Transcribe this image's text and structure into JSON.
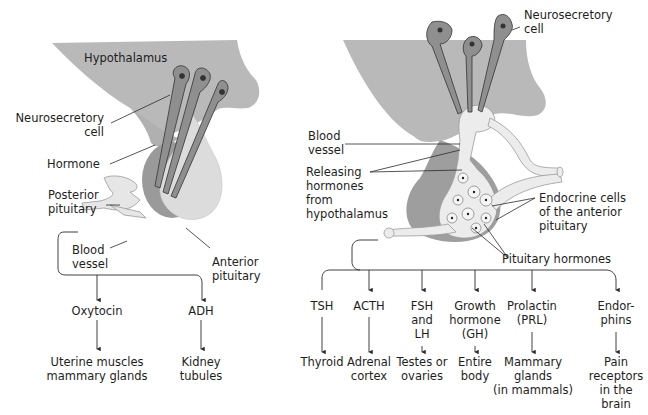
{
  "colors": {
    "hypothalamus": "#b9b9b9",
    "posterior_pituitary": "#9a9a9a",
    "anterior_pituitary": "#dcdcdc",
    "neuron": "#8f8f8f",
    "vessel": "#e6e6e6",
    "line": "#2b2b2b",
    "text": "#1e1e1e"
  },
  "left_panel": {
    "labels": {
      "hypothalamus": "Hypothalamus",
      "neurosecretory_cell": "Neurosecretory\ncell",
      "hormone": "Hormone",
      "posterior_pituitary": "Posterior\npituitary",
      "blood_vessel": "Blood\nvessel",
      "anterior_pituitary": "Anterior\npituitary"
    },
    "hormones": [
      {
        "name": "Oxytocin",
        "target": "Uterine muscles\nmammary glands"
      },
      {
        "name": "ADH",
        "target": "Kidney\ntubules"
      }
    ]
  },
  "right_panel": {
    "labels": {
      "neurosecretory_cell": "Neurosecretory\ncell",
      "blood_vessel": "Blood\nvessel",
      "releasing_hormones": "Releasing\nhormones\nfrom\nhypothalamus",
      "endocrine_cells": "Endocrine cells\nof the anterior\npituitary",
      "pituitary_hormones": "Pituitary hormones"
    },
    "hormones": [
      {
        "name": "TSH",
        "target": "Thyroid"
      },
      {
        "name": "ACTH",
        "target": "Adrenal\ncortex"
      },
      {
        "name": "FSH\nand\nLH",
        "target": "Testes or\novaries"
      },
      {
        "name": "Growth\nhormone\n(GH)",
        "target": "Entire\nbody"
      },
      {
        "name": "Prolactin\n(PRL)",
        "target": "Mammary\nglands\n(in mammals)"
      },
      {
        "name": "Endor-\nphins",
        "target": "Pain\nreceptors\nin the\nbrain"
      }
    ]
  }
}
